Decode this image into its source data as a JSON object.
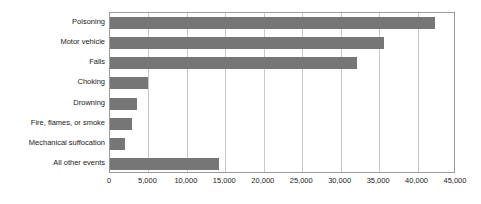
{
  "chart_data": {
    "type": "bar",
    "orientation": "horizontal",
    "title": "",
    "subtitle": "",
    "xlabel": "",
    "ylabel": "",
    "xlim": [
      0,
      45000
    ],
    "ylim": null,
    "grid": true,
    "legend": null,
    "legend_position": "none",
    "bar_color": "#767676",
    "background_color": "#ffffff",
    "gridline_color": "#c9c9c9",
    "axis_color": "#9a9a9a",
    "categories": [
      "Poisoning",
      "Motor vehicle",
      "Falls",
      "Choking",
      "Drowning",
      "Fire, flames, or smoke",
      "Mechanical suffocation",
      "All other events"
    ],
    "values": [
      42250,
      35700,
      32100,
      5000,
      3500,
      2800,
      1900,
      14200
    ],
    "xticks": [
      0,
      5000,
      10000,
      15000,
      20000,
      25000,
      30000,
      35000,
      40000,
      45000
    ],
    "xticklabels": [
      "0",
      "5,000",
      "10,000",
      "15,000",
      "20,000",
      "25,000",
      "30,000",
      "35,000",
      "40,000",
      "45,000"
    ],
    "annotations": []
  }
}
